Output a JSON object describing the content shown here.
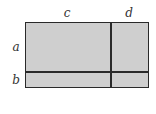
{
  "diagram": {
    "type": "area-model-rectangle",
    "labels": {
      "top_left": "c",
      "top_right": "d",
      "left_top": "a",
      "left_bottom": "b"
    },
    "colors": {
      "fill": "#cfcfcf",
      "stroke": "#2a2a2a",
      "label": "#333333"
    },
    "regions": [
      {
        "name": "ac",
        "row": "a",
        "col": "c"
      },
      {
        "name": "ad",
        "row": "a",
        "col": "d"
      },
      {
        "name": "bc",
        "row": "b",
        "col": "c"
      },
      {
        "name": "bd",
        "row": "b",
        "col": "d"
      }
    ]
  }
}
